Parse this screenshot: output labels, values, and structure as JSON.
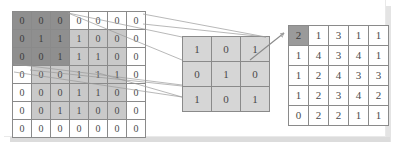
{
  "figure": {
    "title": "",
    "caption": ""
  },
  "colors": {
    "background": "#ffffff",
    "panel": "#ffffff",
    "cell_border": "#8a8a8a",
    "shade_dark": "#8f8f8f",
    "shade_mid": "#c9c9c9",
    "shade_light": "#d6d6d6",
    "highlight": "#9a9a9a",
    "connector": "#9a9a9a",
    "text": "#4a4a4a",
    "shadow": "#dcdcdc"
  },
  "input_matrix": {
    "label": "input-matrix",
    "rows": 7,
    "cols": 7,
    "values": [
      [
        "0",
        "0",
        "0",
        "0",
        "0",
        "0",
        "0"
      ],
      [
        "0",
        "1",
        "1",
        "1",
        "0",
        "0",
        "0"
      ],
      [
        "0",
        "0",
        "1",
        "1",
        "1",
        "0",
        "0"
      ],
      [
        "0",
        "0",
        "0",
        "1",
        "1",
        "1",
        "0"
      ],
      [
        "0",
        "0",
        "0",
        "1",
        "1",
        "0",
        "0"
      ],
      [
        "0",
        "0",
        "1",
        "1",
        "0",
        "0",
        "0"
      ],
      [
        "0",
        "0",
        "0",
        "0",
        "0",
        "0",
        "0"
      ]
    ],
    "shading": [
      [
        "dark",
        "dark",
        "dark",
        "white",
        "white",
        "white",
        "white"
      ],
      [
        "dark",
        "dark",
        "dark",
        "mid",
        "mid",
        "mid",
        "white"
      ],
      [
        "dark",
        "dark",
        "dark",
        "mid",
        "mid",
        "mid",
        "white"
      ],
      [
        "white",
        "mid",
        "mid",
        "mid",
        "mid",
        "mid",
        "white"
      ],
      [
        "white",
        "mid",
        "mid",
        "mid",
        "mid",
        "mid",
        "white"
      ],
      [
        "white",
        "mid",
        "mid",
        "mid",
        "mid",
        "mid",
        "white"
      ],
      [
        "white",
        "white",
        "white",
        "white",
        "white",
        "white",
        "white"
      ]
    ]
  },
  "kernel_matrix": {
    "label": "kernel-matrix",
    "rows": 3,
    "cols": 3,
    "values": [
      [
        "1",
        "0",
        "1"
      ],
      [
        "0",
        "1",
        "0"
      ],
      [
        "1",
        "0",
        "1"
      ]
    ],
    "shading": [
      [
        "light",
        "light",
        "light"
      ],
      [
        "light",
        "light",
        "light"
      ],
      [
        "light",
        "light",
        "light"
      ]
    ]
  },
  "output_matrix": {
    "label": "output-matrix",
    "rows": 5,
    "cols": 5,
    "values": [
      [
        "2",
        "1",
        "3",
        "1",
        "1"
      ],
      [
        "1",
        "4",
        "3",
        "4",
        "1"
      ],
      [
        "1",
        "2",
        "4",
        "3",
        "3"
      ],
      [
        "1",
        "2",
        "3",
        "4",
        "2"
      ],
      [
        "0",
        "2",
        "2",
        "1",
        "1"
      ]
    ],
    "shading": [
      [
        "highlight",
        "white",
        "white",
        "white",
        "white"
      ],
      [
        "white",
        "white",
        "white",
        "white",
        "white"
      ],
      [
        "white",
        "white",
        "white",
        "white",
        "white"
      ],
      [
        "white",
        "white",
        "white",
        "white",
        "white"
      ],
      [
        "white",
        "white",
        "white",
        "white",
        "white"
      ]
    ]
  },
  "chart_data": {
    "type": "heatmap",
    "xlabel": "",
    "ylabel": "",
    "grid": true,
    "legend": "none",
    "panels": [
      {
        "name": "input",
        "rows": 7,
        "cols": 7,
        "values": [
          [
            0,
            0,
            0,
            0,
            0,
            0,
            0
          ],
          [
            0,
            1,
            1,
            1,
            0,
            0,
            0
          ],
          [
            0,
            0,
            1,
            1,
            1,
            0,
            0
          ],
          [
            0,
            0,
            0,
            1,
            1,
            1,
            0
          ],
          [
            0,
            0,
            0,
            1,
            1,
            0,
            0
          ],
          [
            0,
            0,
            1,
            1,
            0,
            0,
            0
          ],
          [
            0,
            0,
            0,
            0,
            0,
            0,
            0
          ]
        ],
        "highlight_window": {
          "row": 0,
          "col": 0,
          "height": 3,
          "width": 3
        }
      },
      {
        "name": "kernel",
        "rows": 3,
        "cols": 3,
        "values": [
          [
            1,
            0,
            1
          ],
          [
            0,
            1,
            0
          ],
          [
            1,
            0,
            1
          ]
        ]
      },
      {
        "name": "output",
        "rows": 5,
        "cols": 5,
        "values": [
          [
            2,
            1,
            3,
            1,
            1
          ],
          [
            1,
            4,
            3,
            4,
            1
          ],
          [
            1,
            2,
            4,
            3,
            3
          ],
          [
            1,
            2,
            3,
            4,
            2
          ],
          [
            0,
            2,
            2,
            1,
            1
          ]
        ],
        "highlight_cell": {
          "row": 0,
          "col": 0,
          "value": 2
        }
      }
    ]
  }
}
